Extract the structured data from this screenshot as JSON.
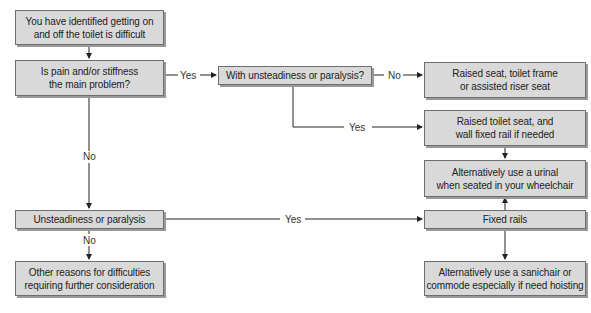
{
  "nodes": {
    "start": [
      "You have identified getting on",
      "and off the toilet is difficult"
    ],
    "q_pain": [
      "Is pain and/or stiffness",
      "the main problem?"
    ],
    "q_unsteady_with": [
      "With unsteadiness or paralysis?"
    ],
    "raised_seat_frame": [
      "Raised seat, toilet frame",
      "or assisted riser seat"
    ],
    "raised_seat_rail": [
      "Raised toilet seat, and",
      "wall fixed rail if needed"
    ],
    "urinal": [
      "Alternatively use a urinal",
      "when seated in your wheelchair"
    ],
    "q_unsteady": [
      "Unsteadiness or paralysis"
    ],
    "fixed_rails": [
      "Fixed rails"
    ],
    "other_reasons": [
      "Other reasons for difficulties",
      "requiring further consideration"
    ],
    "sanichair": [
      "Alternatively use a sanichair or",
      "commode especially if need hoisting"
    ]
  },
  "edge_labels": {
    "pain_yes": "Yes",
    "pain_no": "No",
    "with_unsteady_no": "No",
    "with_unsteady_yes": "Yes",
    "unsteady_yes": "Yes",
    "unsteady_no": "No"
  },
  "colors": {
    "box_fill": "#d9d9d9",
    "box_border": "#6e6e6e",
    "line": "#222222"
  }
}
